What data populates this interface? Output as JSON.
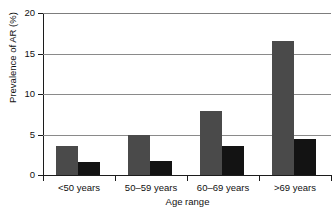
{
  "chart_data": {
    "type": "bar",
    "title": "",
    "xlabel": "Age range",
    "ylabel": "Prevalence of AR (%)",
    "categories": [
      "<50 years",
      "50–59 years",
      "60–69 years",
      ">69 years"
    ],
    "series": [
      {
        "name": "series-a",
        "color": "#4a4a4a",
        "values": [
          3.6,
          5.0,
          7.9,
          16.6
        ]
      },
      {
        "name": "series-b",
        "color": "#131313",
        "values": [
          1.6,
          1.7,
          3.6,
          4.4
        ]
      }
    ],
    "ylim": [
      0,
      20
    ],
    "yticks": [
      0,
      5,
      10,
      15,
      20
    ],
    "ytick_labels": [
      "0",
      "5",
      "10",
      "15",
      "20"
    ],
    "grid": true,
    "grid_axis": "y",
    "legend": false,
    "legend_position": "none"
  }
}
